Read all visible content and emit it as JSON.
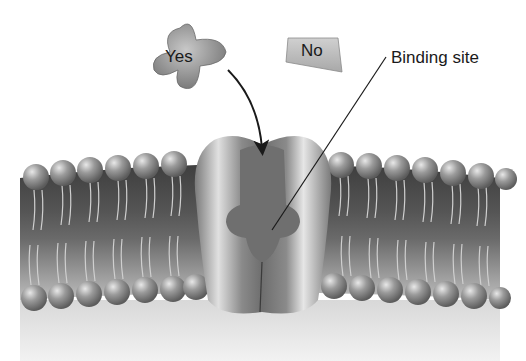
{
  "diagram": {
    "labels": {
      "yes_ligand": "Yes",
      "no_ligand": "No",
      "binding_site": "Binding site"
    },
    "colors": {
      "membrane_dark": "#4a4a4a",
      "membrane_light": "#9a9a9a",
      "head_fill": "#8c8c8c",
      "protein_fill": "#7a7a7a",
      "protein_highlight": "#d8d8d8",
      "background_lower": "#e6e6e6",
      "text": "#1a1a1a"
    }
  }
}
